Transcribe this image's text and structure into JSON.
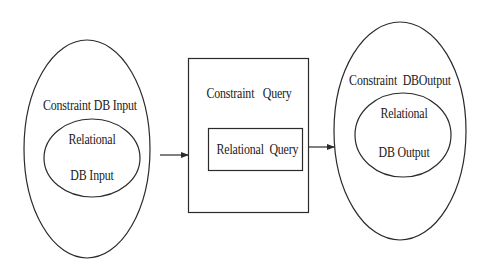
{
  "diagram": {
    "input": {
      "outer_label": "Constraint DB Input",
      "inner_label_line1": "Relational",
      "inner_label_line2": "DB Input"
    },
    "query": {
      "outer_label": "Constraint   Query",
      "inner_label": "Relational  Query"
    },
    "output": {
      "outer_label": "Constraint  DBOutput",
      "inner_label_line1": "Relational",
      "inner_label_line2": "DB Output"
    },
    "edges": [
      {
        "from": "Constraint DB Input",
        "to": "Constraint Query"
      },
      {
        "from": "Constraint Query",
        "to": "Constraint DB Output"
      }
    ],
    "colors": {
      "stroke": "#2a2a2a",
      "background": "#ffffff"
    }
  }
}
